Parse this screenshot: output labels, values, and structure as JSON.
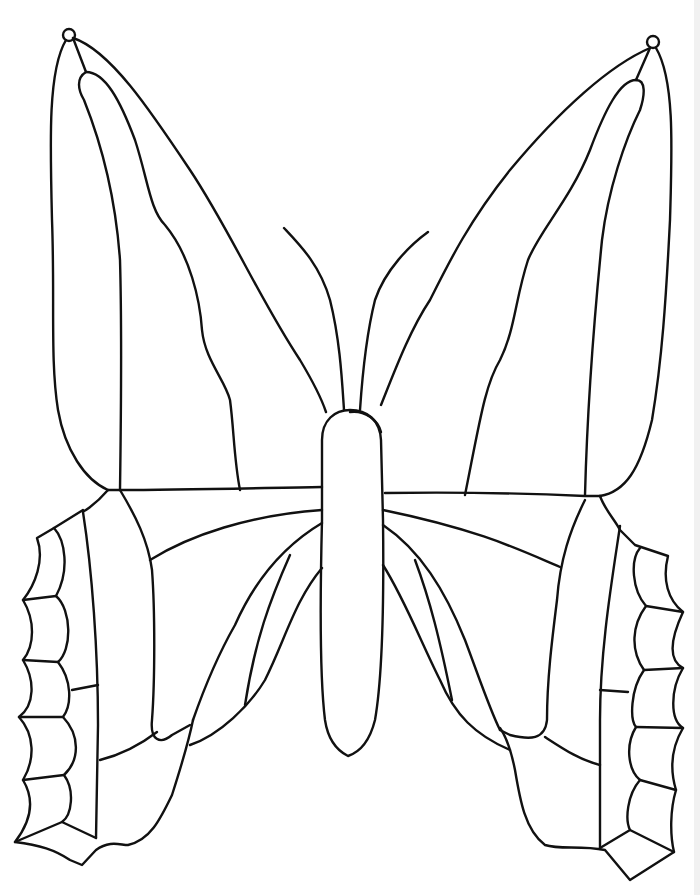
{
  "image": {
    "subject": "butterfly line drawing (coloring page)",
    "background_color": "#ffffff",
    "line_color": "#111111",
    "line_width": 2.4
  },
  "parts": {
    "left_forewing": "left-forewing",
    "right_forewing": "right-forewing",
    "left_hindwing": "left-hindwing",
    "right_hindwing": "right-hindwing",
    "body": "body",
    "left_antenna": "left-antenna",
    "right_antenna": "right-antenna"
  }
}
